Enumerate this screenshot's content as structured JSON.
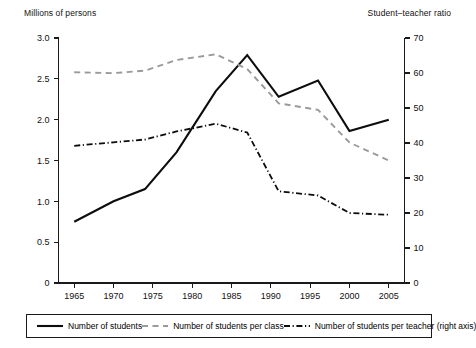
{
  "chart_data": {
    "type": "line",
    "title": "",
    "xlabel": "",
    "ylabel": "Millions of persons",
    "y2label": "Student-teacher ratio",
    "grid": false,
    "legend_position": "bottom",
    "xlim": [
      1963,
      2007
    ],
    "ylim": [
      0,
      3.0
    ],
    "y2lim": [
      0,
      70
    ],
    "x_ticks": [
      1965,
      1970,
      1975,
      1980,
      1985,
      1990,
      1995,
      2000,
      2005
    ],
    "x_tick_labels": [
      "1965",
      "1970",
      "1975",
      "1980",
      "1985",
      "1990",
      "1995",
      "2000",
      "2005"
    ],
    "y_ticks": [
      0,
      0.5,
      1.0,
      1.5,
      2.0,
      2.5,
      3.0
    ],
    "y_tick_labels": [
      "0",
      "0.5",
      "1.0",
      "1.5",
      "2.0",
      "2.5",
      "3.0"
    ],
    "y2_ticks": [
      0,
      10,
      20,
      30,
      40,
      50,
      60,
      70
    ],
    "y2_tick_labels": [
      "0",
      "10",
      "20",
      "30",
      "40",
      "50",
      "60",
      "70"
    ],
    "series": [
      {
        "name": "Number of students",
        "style": "solid",
        "color": "#0d0d0d",
        "axis": "left",
        "x": [
          1965,
          1970,
          1974,
          1978,
          1983,
          1987,
          1991,
          1996,
          2000,
          2005
        ],
        "values": [
          0.75,
          1.0,
          1.15,
          1.6,
          2.35,
          2.79,
          2.28,
          2.48,
          1.86,
          2.0
        ]
      },
      {
        "name": "Number of students per class",
        "style": "dashed",
        "color": "#9a9a9a",
        "axis": "left",
        "x": [
          1965,
          1970,
          1974,
          1978,
          1983,
          1987,
          1991,
          1996,
          2000,
          2005
        ],
        "values": [
          2.58,
          2.57,
          2.6,
          2.73,
          2.8,
          2.62,
          2.2,
          2.12,
          1.72,
          1.5
        ]
      },
      {
        "name": "Number of students per teacher (right axis)",
        "style": "dashdot",
        "color": "#0d0d0d",
        "axis": "right",
        "x": [
          1965,
          1970,
          1974,
          1978,
          1983,
          1987,
          1991,
          1996,
          2000,
          2005
        ],
        "values": [
          39.2,
          40.2,
          41.0,
          43.3,
          45.5,
          43.0,
          26.2,
          25.0,
          20.0,
          19.5
        ]
      }
    ]
  },
  "labels": {
    "left_axis_caption": "Millions of persons",
    "right_axis_caption": "Student–teacher ratio"
  },
  "legend": {
    "entries": [
      {
        "label": "Number of students",
        "style": "solid",
        "color": "#0d0d0d"
      },
      {
        "label": "Number of students per class",
        "style": "dashed",
        "color": "#9a9a9a"
      },
      {
        "label": "Number of students per teacher (right axis)",
        "style": "dashdot",
        "color": "#0d0d0d"
      }
    ]
  }
}
